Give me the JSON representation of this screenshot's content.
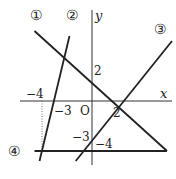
{
  "diagram": {
    "axes": {
      "x_label": "x",
      "y_label": "y",
      "origin_label": "O"
    },
    "tick_labels": {
      "x_neg4": "−4",
      "x_neg3": "−3",
      "x_2": "2",
      "y_2": "2",
      "y_neg3": "−3",
      "y_neg4": "−4"
    },
    "lines": [
      {
        "id": "line-1",
        "label": "①",
        "p1": [
          -4.6,
          5.6
        ],
        "p2": [
          6,
          -4
        ],
        "equation": "y = -x + 2"
      },
      {
        "id": "line-2",
        "label": "②",
        "p1": [
          -1.8,
          5.2
        ],
        "p2": [
          -4.2,
          -4.8
        ],
        "equation": "y = 4x + 12"
      },
      {
        "id": "line-3",
        "label": "③",
        "p1": [
          6.4,
          4.8
        ],
        "p2": [
          -1.3,
          -4.8
        ],
        "equation": "y = 3/2 x - 3"
      },
      {
        "id": "line-4",
        "label": "④",
        "p1": [
          -4.6,
          -4
        ],
        "p2": [
          6,
          -4
        ],
        "equation": "y = -4"
      }
    ],
    "guide": {
      "x": -4,
      "from_y": 0,
      "to_y": -4
    }
  }
}
